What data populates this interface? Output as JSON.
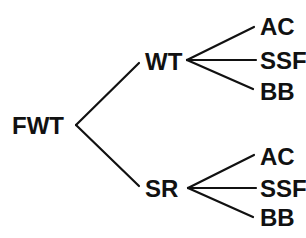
{
  "diagram": {
    "type": "tree",
    "root": {
      "label": "FWT",
      "children": [
        {
          "label": "WT",
          "children": [
            {
              "label": "AC"
            },
            {
              "label": "SSF"
            },
            {
              "label": "BB"
            }
          ]
        },
        {
          "label": "SR",
          "children": [
            {
              "label": "AC"
            },
            {
              "label": "SSF"
            },
            {
              "label": "BB"
            }
          ]
        }
      ]
    },
    "line_color": "#111111",
    "text_color": "#111111",
    "background": "#ffffff"
  }
}
